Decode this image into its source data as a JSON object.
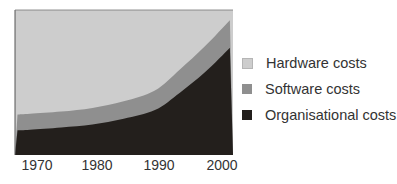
{
  "chart_data": {
    "type": "area",
    "stacked": true,
    "normalized": true,
    "title": "",
    "xlabel": "",
    "ylabel": "",
    "x": [
      1968,
      1970,
      1975,
      1980,
      1985,
      1990,
      1994,
      1998,
      2002
    ],
    "x_ticks": [
      "1970",
      "1980",
      "1990",
      "2000"
    ],
    "xlim": [
      1967.6,
      2002.5
    ],
    "ylim": [
      0,
      100
    ],
    "grid": false,
    "legend_position": "right",
    "series": [
      {
        "name": "Organisational costs",
        "color": "#231f1c",
        "values": [
          17,
          17.5,
          19,
          21,
          25,
          31,
          43,
          57,
          74
        ]
      },
      {
        "name": "Software costs",
        "color": "#8f8f8f",
        "values": [
          11,
          11,
          11,
          11.5,
          12,
          13.5,
          16,
          18,
          19
        ]
      },
      {
        "name": "Hardware costs",
        "color": "#cdcdcd",
        "values": [
          72,
          71.5,
          70,
          67.5,
          63,
          55.5,
          41,
          25,
          7
        ]
      }
    ]
  },
  "legend": {
    "items": [
      {
        "label": "Hardware costs",
        "color": "#cdcdcd"
      },
      {
        "label": "Software costs",
        "color": "#8f8f8f"
      },
      {
        "label": "Organisational costs",
        "color": "#231f1c"
      }
    ]
  },
  "axis": {
    "ticks": [
      {
        "label": "1970",
        "x": 30
      },
      {
        "label": "1980",
        "x": 92
      },
      {
        "label": "1990",
        "x": 155
      },
      {
        "label": "2000",
        "x": 218
      }
    ]
  }
}
